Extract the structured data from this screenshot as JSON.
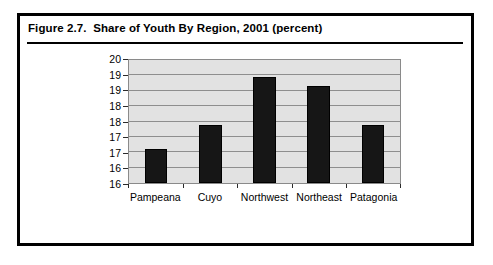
{
  "figure": {
    "caption": "Figure 2.7.  Share of Youth By Region, 2001 (percent)"
  },
  "colors": {
    "bar": "#161616",
    "plot_background": "#e2e2e2",
    "gridline": "#8e8e8e",
    "border": "#000000"
  },
  "chart_data": {
    "type": "bar",
    "title": "Figure 2.7.  Share of Youth By Region, 2001 (percent)",
    "xlabel": "",
    "ylabel": "",
    "categories": [
      "Pampeana",
      "Cuyo",
      "Northwest",
      "Northeast",
      "Patagonia"
    ],
    "values": [
      17.1,
      17.9,
      19.45,
      19.15,
      17.9
    ],
    "ylim": [
      16,
      20
    ],
    "ytick_values": [
      16.0,
      16.5,
      17.0,
      17.5,
      18.0,
      18.5,
      19.0,
      19.5,
      20.0
    ],
    "ytick_labels": [
      "16",
      "16",
      "17",
      "17",
      "18",
      "18",
      "19",
      "19",
      "20"
    ],
    "grid": true,
    "legend": false
  }
}
